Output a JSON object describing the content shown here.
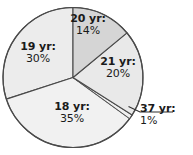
{
  "chart_data": {
    "type": "pie",
    "title": "",
    "categories": [
      "20 yr",
      "21 yr",
      "37 yr",
      "18 yr",
      "19 yr"
    ],
    "values": [
      14,
      20,
      1,
      35,
      30
    ],
    "labels": [
      "20 yr:",
      "21 yr:",
      "37 yr:",
      "18 yr:",
      "19 yr:"
    ],
    "value_labels": [
      "14%",
      "20%",
      "1%",
      "35%",
      "30%"
    ],
    "start_angle_deg": 0,
    "direction": "clockwise",
    "legend": "none",
    "grid": false,
    "slice_colors": [
      "#d5d5d5",
      "#e9e9e9",
      "#efefef",
      "#f1f1f1",
      "#ececec"
    ],
    "outline_color": "#4a4a4a",
    "leader_line_for": "37 yr",
    "units": "%"
  },
  "slices": [
    {
      "name": "20 yr:",
      "pct": "14%",
      "value": 14,
      "color": "#d5d5d5"
    },
    {
      "name": "21 yr:",
      "pct": "20%",
      "value": 20,
      "color": "#e9e9e9"
    },
    {
      "name": "37 yr:",
      "pct": "1%",
      "value": 1,
      "color": "#efefef"
    },
    {
      "name": "18 yr:",
      "pct": "35%",
      "value": 35,
      "color": "#f1f1f1"
    },
    {
      "name": "19 yr:",
      "pct": "30%",
      "value": 30,
      "color": "#ececec"
    }
  ]
}
